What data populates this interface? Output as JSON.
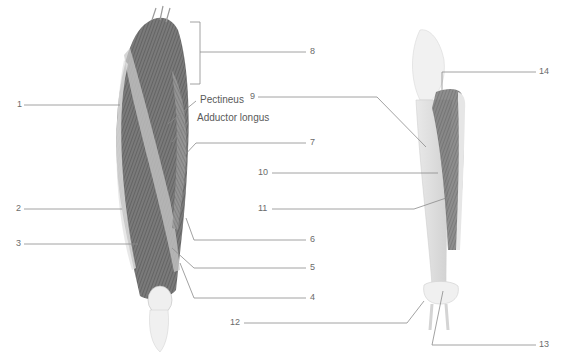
{
  "figure": {
    "colors": {
      "leader_line": "#8a8a8a",
      "muscle_dark": "#5e5e5e",
      "muscle_mid": "#8c8c8c",
      "bone": "#dcdcdc",
      "label_text": "#6b6b6b"
    }
  },
  "labels": {
    "named": [
      {
        "id": "pectineus",
        "text": "Pectineus"
      },
      {
        "id": "adductor-longus",
        "text": "Adductor longus"
      }
    ],
    "numbers": [
      {
        "id": "n1",
        "text": "1"
      },
      {
        "id": "n2",
        "text": "2"
      },
      {
        "id": "n3",
        "text": "3"
      },
      {
        "id": "n4",
        "text": "4"
      },
      {
        "id": "n5",
        "text": "5"
      },
      {
        "id": "n6",
        "text": "6"
      },
      {
        "id": "n7",
        "text": "7"
      },
      {
        "id": "n8",
        "text": "8"
      },
      {
        "id": "n9",
        "text": "9"
      },
      {
        "id": "n10",
        "text": "10"
      },
      {
        "id": "n11",
        "text": "11"
      },
      {
        "id": "n12",
        "text": "12"
      },
      {
        "id": "n13",
        "text": "13"
      },
      {
        "id": "n14",
        "text": "14"
      }
    ]
  }
}
